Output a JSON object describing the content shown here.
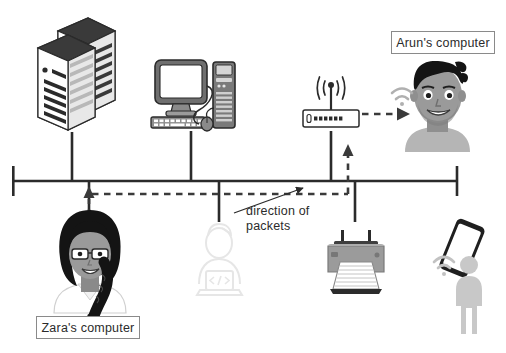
{
  "diagram": {
    "background_color": "#ffffff",
    "backbone": {
      "label": "network-backbone-bus",
      "color": "#2b2b2b",
      "y": 181,
      "x_start": 13,
      "x_end": 458
    },
    "packet_path": {
      "color": "#3a3a3a",
      "style": "dashed",
      "description": "packets travel from Zara's computer up to the bus, right along the bus, then up to the wireless access point and across to Arun's computer"
    }
  },
  "labels": {
    "arun": "Arun's computer",
    "zara": "Zara's computer",
    "direction_line1": "direction of",
    "direction_line2": "packets"
  },
  "nodes": [
    {
      "id": "servers",
      "name": "server-stack-icon",
      "x": 72,
      "attached": true
    },
    {
      "id": "desktop",
      "name": "desktop-computer-icon",
      "x": 191,
      "attached": true
    },
    {
      "id": "access_point",
      "name": "wireless-access-point-icon",
      "x": 331,
      "attached": true
    },
    {
      "id": "zara",
      "name": "zara-person-icon",
      "x": 89,
      "attached": true
    },
    {
      "id": "dev_person",
      "name": "developer-laptop-icon-faded",
      "x": 219,
      "attached": true
    },
    {
      "id": "printer",
      "name": "printer-icon",
      "x": 355,
      "attached": true
    },
    {
      "id": "arun",
      "name": "arun-person-icon",
      "x": 437,
      "attached": false
    },
    {
      "id": "smartphone",
      "name": "smartphone-icon",
      "x": 460,
      "attached": false
    },
    {
      "id": "phone_person",
      "name": "phone-user-silhouette-icon",
      "x": 468,
      "attached": false
    }
  ],
  "colors": {
    "line": "#2b2b2b",
    "dash": "#3a3a3a",
    "label_border": "#8a8a8a",
    "text": "#2b2b2b",
    "faded": "#e4e4e4",
    "device_gray": "#9b9b9b",
    "device_dark": "#4a4a4a",
    "skin": "#a6a6a6",
    "hair": "#1f1f1f"
  }
}
